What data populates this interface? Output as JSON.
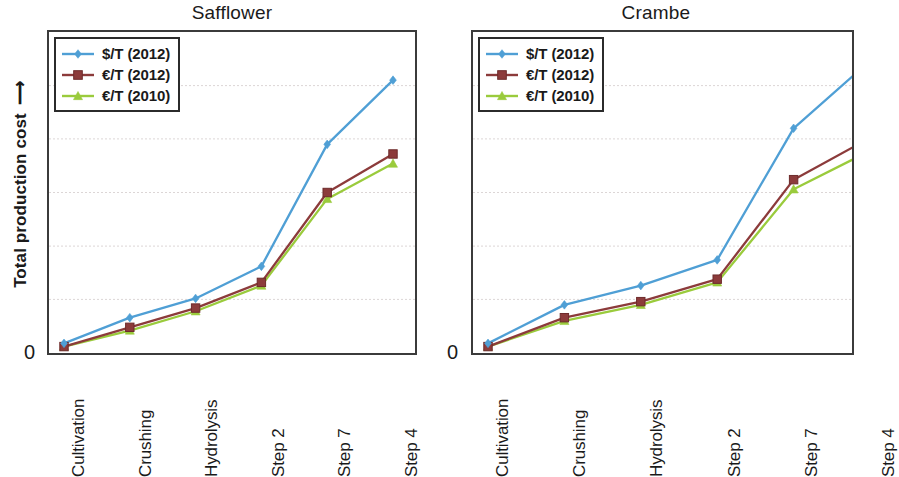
{
  "figure": {
    "y_axis_label": "Total production cost",
    "y_axis_arrow": "⟶",
    "y_zero_label": "0"
  },
  "panels": [
    {
      "title": "Safflower"
    },
    {
      "title": "Crambe"
    }
  ],
  "legend": {
    "entries": [
      {
        "label": "$/T (2012)",
        "marker": "diamond",
        "color": "#4f9fd5"
      },
      {
        "label": "€/T (2012)",
        "marker": "square",
        "color": "#8c3b3b"
      },
      {
        "label": "€/T (2010)",
        "marker": "triangle",
        "color": "#9acb3c"
      }
    ]
  },
  "chart_data": [
    {
      "type": "line",
      "title": "Safflower",
      "xlabel": "",
      "ylabel": "Total production cost",
      "ylim": [
        0,
        100
      ],
      "yticks": [
        0
      ],
      "grid": true,
      "gridlines": [
        16.7,
        33.3,
        50,
        66.7,
        83.3
      ],
      "legend_position": "top-left",
      "categories": [
        "Cultivation",
        "Crushing",
        "Hydrolysis",
        "Step 2",
        "Step 7",
        "Step 4"
      ],
      "series": [
        {
          "name": "$/T (2012)",
          "color": "#4f9fd5",
          "marker": "diamond",
          "values": [
            3,
            11,
            17,
            27,
            65,
            85
          ]
        },
        {
          "name": "€/T (2012)",
          "color": "#8c3b3b",
          "marker": "square",
          "values": [
            2,
            8,
            14,
            22,
            50,
            62
          ]
        },
        {
          "name": "€/T (2010)",
          "color": "#9acb3c",
          "marker": "triangle",
          "values": [
            2,
            7,
            13,
            21,
            48,
            59
          ]
        }
      ]
    },
    {
      "type": "line",
      "title": "Crambe",
      "xlabel": "",
      "ylabel": "Total production cost",
      "ylim": [
        0,
        100
      ],
      "yticks": [
        0
      ],
      "grid": true,
      "gridlines": [
        16.7,
        33.3,
        50,
        66.7,
        83.3
      ],
      "legend_position": "top-left",
      "categories": [
        "Cultivation",
        "Crushing",
        "Hydrolysis",
        "Step 2",
        "Step 7",
        "Step 4"
      ],
      "series": [
        {
          "name": "$/T (2012)",
          "color": "#4f9fd5",
          "marker": "diamond",
          "values": [
            3,
            15,
            21,
            29,
            70,
            91
          ]
        },
        {
          "name": "€/T (2012)",
          "color": "#8c3b3b",
          "marker": "square",
          "values": [
            2,
            11,
            16,
            23,
            54,
            67
          ]
        },
        {
          "name": "€/T (2010)",
          "color": "#9acb3c",
          "marker": "triangle",
          "values": [
            2,
            10,
            15,
            22,
            51,
            63
          ]
        }
      ]
    }
  ]
}
